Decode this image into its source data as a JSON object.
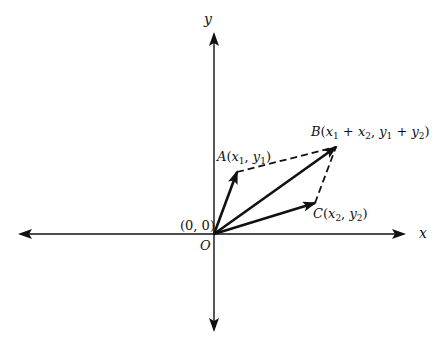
{
  "diagram": {
    "title": "",
    "axes": {
      "x_label": "x",
      "y_label": "y",
      "origin_label": "O",
      "origin_coord": "(0, 0)"
    },
    "points": {
      "A": {
        "name": "A",
        "coords_label": "(x₁, y₁)",
        "px": [
          237,
          172
        ]
      },
      "B": {
        "name": "B",
        "coords_label": "(x₁ + x₂, y₁ + y₂)",
        "px": [
          336,
          147
        ]
      },
      "C": {
        "name": "C",
        "coords_label": "(x₂, y₂)",
        "px": [
          315,
          203
        ]
      },
      "O": {
        "name": "O",
        "px": [
          214,
          234
        ]
      }
    },
    "vectors": [
      {
        "from": "O",
        "to": "A",
        "style": "solid-arrow"
      },
      {
        "from": "O",
        "to": "B",
        "style": "solid-arrow"
      },
      {
        "from": "O",
        "to": "C",
        "style": "solid-arrow"
      }
    ],
    "dashed_segments": [
      {
        "from": "A",
        "to": "B"
      },
      {
        "from": "C",
        "to": "B"
      }
    ],
    "colors": {
      "ink": "#111111",
      "background": "#ffffff"
    }
  },
  "labels": {
    "y_axis": "y",
    "x_axis": "x",
    "origin": "O",
    "origin_coord": "(0, 0)",
    "A_name": "A",
    "A_open": "(",
    "A_x": "x",
    "A_x_sub": "1",
    "A_sep": ", ",
    "A_y": "y",
    "A_y_sub": "1",
    "A_close": ")",
    "B_name": "B",
    "B_open": "(",
    "B_x1": "x",
    "B_x1_sub": "1",
    "B_plus1": " + ",
    "B_x2": "x",
    "B_x2_sub": "2",
    "B_sep": ", ",
    "B_y1": "y",
    "B_y1_sub": "1",
    "B_plus2": " + ",
    "B_y2": "y",
    "B_y2_sub": "2",
    "B_close": ")",
    "C_name": "C",
    "C_open": "(",
    "C_x": "x",
    "C_x_sub": "2",
    "C_sep": ", ",
    "C_y": "y",
    "C_y_sub": "2",
    "C_close": ")"
  }
}
